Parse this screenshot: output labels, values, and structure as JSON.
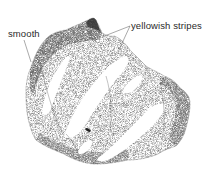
{
  "figure": {
    "labels": [
      {
        "id": "smooth",
        "text": "smooth"
      },
      {
        "id": "stripes",
        "text": "yellowish stripes"
      }
    ],
    "colors": {
      "ink": "#2a2a2a",
      "background": "#ffffff",
      "stipple_dark": "#3a3a3a",
      "stipple_light": "#9a9a9a"
    }
  }
}
